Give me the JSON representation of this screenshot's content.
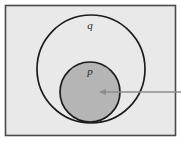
{
  "figure": {
    "type": "euler-venn-diagram",
    "labels": {
      "outer_set": "q",
      "inner_set": "p"
    },
    "colors": {
      "page_background": "#ffffff",
      "frame_border": "#4a4a4a",
      "universe_fill": "#e9e9e9",
      "outer_circle_stroke": "#1c1c1c",
      "outer_circle_fill": "#e9e9e9",
      "inner_circle_stroke": "#1c1c1c",
      "inner_circle_fill": "#b5b5b5",
      "arrow": "#8c8c8c",
      "label_text": "#2a2a2a"
    },
    "geometry": {
      "frame": {
        "x": 5,
        "y": 5,
        "width": 171,
        "height": 131
      },
      "outer_circle": {
        "cx": 91,
        "cy": 69,
        "r": 54
      },
      "inner_circle": {
        "cx": 90,
        "cy": 92,
        "r": 30
      },
      "outer_label_pos": {
        "x": 90,
        "y": 26
      },
      "inner_label_pos": {
        "x": 90,
        "y": 72
      },
      "arrow": {
        "x_tail": 181,
        "x_head": 100,
        "y": 92
      }
    }
  }
}
